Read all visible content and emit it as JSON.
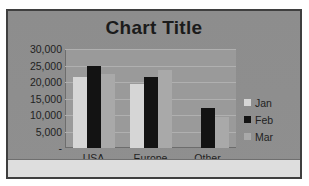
{
  "chart_data": {
    "type": "bar",
    "title": "Chart Title",
    "xlabel": "",
    "ylabel": "",
    "categories": [
      "USA",
      "Europe",
      "Other"
    ],
    "series": [
      {
        "name": "Jan",
        "color": "#d6d6d6",
        "values": [
          21500,
          19500,
          0
        ]
      },
      {
        "name": "Feb",
        "color": "#131313",
        "values": [
          25000,
          21500,
          12000
        ]
      },
      {
        "name": "Mar",
        "color": "#a9a9a9",
        "values": [
          22500,
          23500,
          9500
        ]
      }
    ],
    "ylim": [
      0,
      30000
    ],
    "y_ticks": [
      {
        "value": 30000,
        "label": "30,000"
      },
      {
        "value": 25000,
        "label": "25,000"
      },
      {
        "value": 20000,
        "label": "20,000"
      },
      {
        "value": 15000,
        "label": "15,000"
      },
      {
        "value": 10000,
        "label": "10,000"
      },
      {
        "value": 5000,
        "label": "5,000"
      },
      {
        "value": 0,
        "label": "-"
      }
    ],
    "grid": true,
    "legend_position": "right",
    "plot_background": "#9a9a9a",
    "chart_background": "#8f8f8f",
    "border_color": "#3f3f3f"
  }
}
